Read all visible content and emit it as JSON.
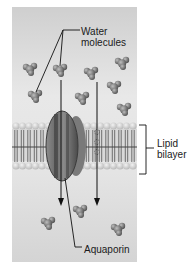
{
  "figure": {
    "labels": {
      "water_line1": "Water",
      "water_line2": "molecules",
      "lipid_line1": "Lipid",
      "lipid_line2": "bilayer",
      "aquaporin": "Aquaporin"
    },
    "colors": {
      "panel_bg": "#d2d2d2",
      "panel_bg_light": "#e6e6e6",
      "molecule": "#6e6e6e",
      "protein": "#5a5a5a",
      "lipid_head": "#c8c8c8",
      "lipid_tail": "#8a8a8a",
      "line": "#1a1a1a"
    },
    "water_molecules": [
      {
        "x": 30,
        "y": 68
      },
      {
        "x": 60,
        "y": 69
      },
      {
        "x": 91,
        "y": 72
      },
      {
        "x": 122,
        "y": 62
      },
      {
        "x": 35,
        "y": 95
      },
      {
        "x": 82,
        "y": 97
      },
      {
        "x": 114,
        "y": 86
      },
      {
        "x": 124,
        "y": 108
      },
      {
        "x": 80,
        "y": 210
      },
      {
        "x": 48,
        "y": 222
      },
      {
        "x": 118,
        "y": 228
      }
    ],
    "arrows": [
      {
        "name": "through-aquaporin",
        "x": 61,
        "y1": 80,
        "y2": 205
      },
      {
        "name": "through-bilayer",
        "x": 97,
        "y1": 82,
        "y2": 205
      }
    ]
  }
}
